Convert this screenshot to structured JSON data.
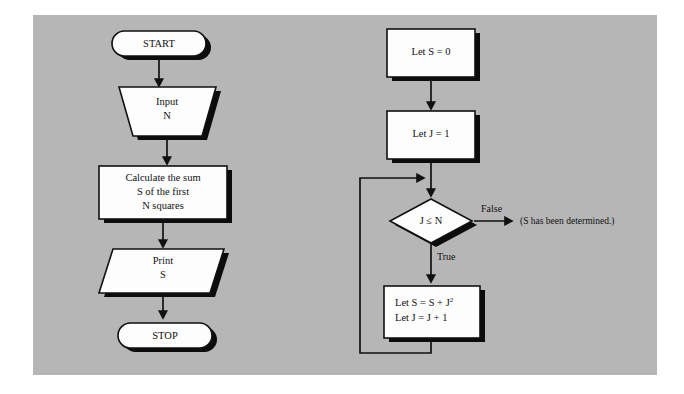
{
  "figure": {
    "background_color": "#ffffff",
    "panel_color": "#b6b6b6",
    "shape_fill_color": "#fdfdfd",
    "line_color": "#111111",
    "shadow_color": "#0c0c0c"
  },
  "left_flowchart": {
    "name": "high-level-algorithm",
    "nodes": [
      {
        "id": "start",
        "type": "terminator",
        "label": "START"
      },
      {
        "id": "input",
        "type": "trapezoid",
        "line1": "Input",
        "line2": "N"
      },
      {
        "id": "calculate",
        "type": "process",
        "line1": "Calculate the sum",
        "line2": "S of the first",
        "line3": "N squares"
      },
      {
        "id": "print",
        "type": "parallelogram",
        "line1": "Print",
        "line2": "S"
      },
      {
        "id": "stop",
        "type": "terminator",
        "label": "STOP"
      }
    ],
    "connectors": [
      {
        "from": "start",
        "to": "input",
        "label": ""
      },
      {
        "from": "input",
        "to": "calculate",
        "label": ""
      },
      {
        "from": "calculate",
        "to": "print",
        "label": ""
      },
      {
        "from": "print",
        "to": "stop",
        "label": ""
      }
    ]
  },
  "right_flowchart": {
    "name": "summation-loop-detail",
    "nodes": [
      {
        "id": "let-s-zero",
        "type": "process",
        "label": "Let S = 0"
      },
      {
        "id": "let-j-one",
        "type": "process",
        "label": "Let J = 1"
      },
      {
        "id": "test",
        "type": "decision",
        "label": "J ≤ N"
      },
      {
        "id": "accumulate",
        "type": "process",
        "line1_pre": "Let S = S + J",
        "line1_sup": "2",
        "line2": "Let J = J + 1"
      }
    ],
    "connectors": [
      {
        "from": "let-s-zero",
        "to": "let-j-one",
        "label": ""
      },
      {
        "from": "let-j-one",
        "to": "test",
        "label": ""
      },
      {
        "from": "test",
        "to": "exit",
        "label": "False"
      },
      {
        "from": "test",
        "to": "accumulate",
        "label": "True"
      },
      {
        "from": "accumulate",
        "to": "test",
        "label": ""
      }
    ],
    "annotation": "(S has been determined.)"
  }
}
